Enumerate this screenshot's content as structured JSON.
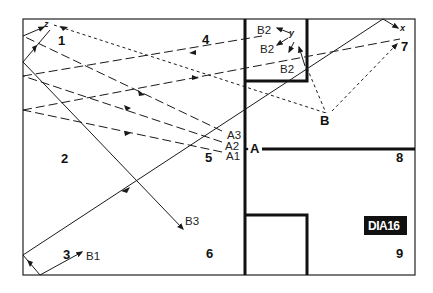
{
  "diagram": {
    "badge": "DIA16",
    "zones": [
      "1",
      "2",
      "3",
      "4",
      "5",
      "6",
      "7",
      "8",
      "9"
    ],
    "points": {
      "A": "A",
      "B": "B"
    },
    "ray_labels": {
      "a1": "A1",
      "a2": "A2",
      "a3": "A3",
      "b1": "B1",
      "b2_top": "B2",
      "b2_mid": "B2",
      "b2_low": "B2",
      "b3": "B3"
    },
    "axes": {
      "x": "x",
      "y": "y",
      "z": "z"
    },
    "colors": {
      "line": "#1a1a1a",
      "background": "#ffffff",
      "badge_bg": "#111111",
      "badge_text": "#ffffff"
    }
  }
}
